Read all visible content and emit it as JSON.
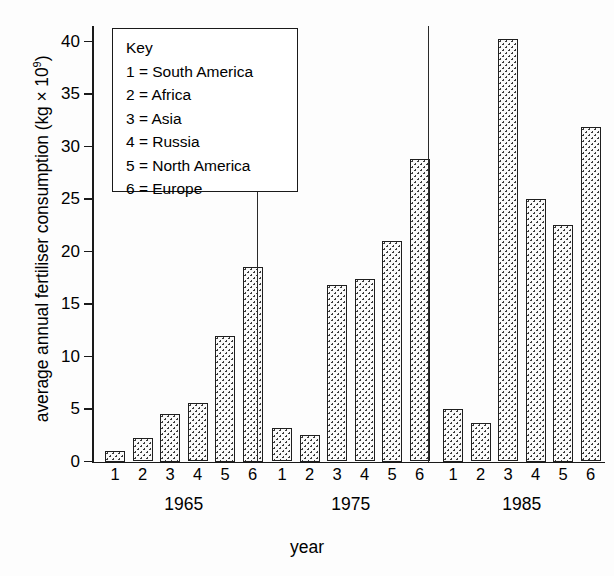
{
  "chart_data": {
    "type": "bar",
    "title": "",
    "xlabel": "year",
    "ylabel": "average annual fertiliser consumption (kg × 10⁹)",
    "ylim": [
      0,
      41
    ],
    "ytick_values": [
      0,
      5,
      10,
      15,
      20,
      25,
      30,
      35,
      40
    ],
    "ytick_labels": [
      "0",
      "5",
      "10",
      "15",
      "20",
      "25",
      "30",
      "35",
      "40"
    ],
    "grid": false,
    "legend_position": "upper-left-inset",
    "categories": [
      "1",
      "2",
      "3",
      "4",
      "5",
      "6"
    ],
    "category_meaning": [
      "South America",
      "Africa",
      "Asia",
      "Russia",
      "North America",
      "Europe"
    ],
    "groups": [
      "1965",
      "1975",
      "1985"
    ],
    "series": [
      {
        "name": "1965",
        "values": [
          1.0,
          2.2,
          4.5,
          5.6,
          12.0,
          18.5
        ]
      },
      {
        "name": "1975",
        "values": [
          3.2,
          2.5,
          16.8,
          17.4,
          21.0,
          28.8
        ]
      },
      {
        "name": "1985",
        "values": [
          5.0,
          3.7,
          40.2,
          25.0,
          22.5,
          31.9
        ]
      }
    ]
  },
  "axes": {
    "y_title_main": "average annual fertiliser consumption (kg × 10",
    "y_title_sup": "9",
    "y_title_close": ")",
    "x_title": "year"
  },
  "key": {
    "heading": "Key",
    "entries": [
      {
        "num": "1",
        "label": "1 = South America"
      },
      {
        "num": "2",
        "label": "2 = Africa"
      },
      {
        "num": "3",
        "label": "3 = Asia"
      },
      {
        "num": "4",
        "label": "4 = Russia"
      },
      {
        "num": "5",
        "label": "5 = North America"
      },
      {
        "num": "6",
        "label": "6 = Europe"
      }
    ]
  },
  "colors": {
    "ink": "#1a1a1a",
    "bar_fill": "#fafafa",
    "bar_stipple": "#3b3b3b",
    "background": "#fdfdfd"
  }
}
